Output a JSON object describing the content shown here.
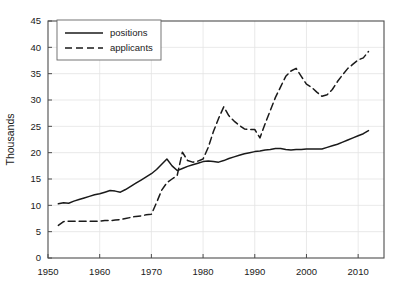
{
  "chart_data": {
    "type": "line",
    "title": "",
    "xlabel": "",
    "ylabel": "Thousands",
    "xlim": [
      1950,
      2015
    ],
    "ylim": [
      0,
      45
    ],
    "xticks": [
      1950,
      1960,
      1970,
      1980,
      1990,
      2000,
      2010
    ],
    "yticks": [
      0,
      5,
      10,
      15,
      20,
      25,
      30,
      35,
      40,
      45
    ],
    "grid": true,
    "legend_position": "upper-left",
    "series": [
      {
        "name": "positions",
        "style": "solid",
        "color": "#1a1a1a",
        "x": [
          1952,
          1953,
          1954,
          1955,
          1956,
          1957,
          1958,
          1959,
          1960,
          1961,
          1962,
          1963,
          1964,
          1965,
          1966,
          1967,
          1968,
          1969,
          1970,
          1971,
          1972,
          1973,
          1974,
          1975,
          1976,
          1977,
          1978,
          1979,
          1980,
          1981,
          1982,
          1983,
          1984,
          1985,
          1986,
          1987,
          1988,
          1989,
          1990,
          1991,
          1992,
          1993,
          1994,
          1995,
          1996,
          1997,
          1998,
          1999,
          2000,
          2001,
          2002,
          2003,
          2004,
          2005,
          2006,
          2007,
          2008,
          2009,
          2010,
          2011,
          2012
        ],
        "values": [
          10.3,
          10.5,
          10.4,
          10.8,
          11.1,
          11.4,
          11.7,
          12.0,
          12.2,
          12.5,
          12.8,
          12.7,
          12.5,
          13.0,
          13.6,
          14.2,
          14.8,
          15.4,
          16.0,
          16.8,
          17.8,
          18.8,
          17.5,
          16.6,
          17.0,
          17.4,
          17.7,
          18.0,
          18.3,
          18.4,
          18.3,
          18.2,
          18.5,
          18.9,
          19.2,
          19.5,
          19.8,
          20.0,
          20.2,
          20.3,
          20.5,
          20.6,
          20.8,
          20.8,
          20.6,
          20.5,
          20.6,
          20.6,
          20.7,
          20.7,
          20.7,
          20.7,
          21.0,
          21.3,
          21.6,
          22.0,
          22.4,
          22.8,
          23.2,
          23.6,
          24.2
        ]
      },
      {
        "name": "applicants",
        "style": "dashed",
        "color": "#1a1a1a",
        "x": [
          1952,
          1953,
          1954,
          1955,
          1956,
          1957,
          1958,
          1959,
          1960,
          1961,
          1962,
          1963,
          1964,
          1965,
          1966,
          1967,
          1968,
          1969,
          1970,
          1971,
          1972,
          1973,
          1974,
          1975,
          1976,
          1977,
          1978,
          1979,
          1980,
          1981,
          1982,
          1983,
          1984,
          1985,
          1986,
          1987,
          1988,
          1989,
          1990,
          1991,
          1992,
          1993,
          1994,
          1995,
          1996,
          1997,
          1998,
          1999,
          2000,
          2001,
          2002,
          2003,
          2004,
          2005,
          2006,
          2007,
          2008,
          2009,
          2010,
          2011,
          2012
        ],
        "values": [
          6.2,
          6.9,
          7.0,
          7.0,
          7.0,
          7.0,
          7.0,
          7.0,
          7.0,
          7.1,
          7.1,
          7.2,
          7.3,
          7.5,
          7.7,
          7.9,
          8.0,
          8.2,
          8.3,
          10.5,
          12.9,
          14.3,
          15.0,
          15.7,
          20.1,
          18.5,
          18.2,
          18.4,
          18.8,
          21.0,
          24.0,
          26.5,
          28.7,
          27.0,
          26.0,
          25.2,
          24.5,
          24.4,
          24.4,
          22.8,
          25.5,
          28.0,
          30.5,
          32.5,
          34.5,
          35.5,
          36.0,
          34.5,
          33.0,
          32.4,
          31.5,
          30.7,
          31.0,
          32.0,
          33.5,
          34.8,
          36.0,
          36.8,
          37.6,
          38.0,
          39.2
        ]
      }
    ]
  },
  "legend": {
    "entries": [
      {
        "label": "positions"
      },
      {
        "label": "applicants"
      }
    ]
  },
  "axes": {
    "y_title": "Thousands",
    "x_tick_labels": [
      "1950",
      "1960",
      "1970",
      "1980",
      "1990",
      "2000",
      "2010"
    ],
    "y_tick_labels": [
      "0",
      "5",
      "10",
      "15",
      "20",
      "25",
      "30",
      "35",
      "40",
      "45"
    ]
  },
  "colors": {
    "line": "#1a1a1a",
    "grid": "#e3e3e3",
    "frame": "#4d4d4d",
    "background": "#ffffff"
  }
}
